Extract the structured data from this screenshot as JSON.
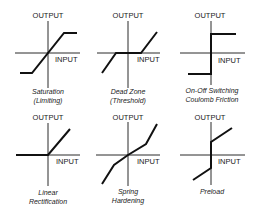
{
  "axis_labels": {
    "y": "OUTPUT",
    "x": "INPUT"
  },
  "panels": [
    {
      "id": "saturation",
      "caption_line1": "Saturation",
      "caption_line2": "(Limiting)"
    },
    {
      "id": "dead-zone",
      "caption_line1": "Dead Zone",
      "caption_line2": "(Threshold)"
    },
    {
      "id": "on-off",
      "caption_line1": "On-Off Switching",
      "caption_line2": "Coulomb Friction"
    },
    {
      "id": "linear-rectification",
      "caption_line1": "Linear",
      "caption_line2": "Rectification"
    },
    {
      "id": "spring-hardening",
      "caption_line1": "Spring",
      "caption_line2": "Hardening"
    },
    {
      "id": "preload",
      "caption_line1": "Preload",
      "caption_line2": ""
    }
  ],
  "colors": {
    "line": "#111111",
    "axis": "#2a2a2a",
    "background": "#ffffff"
  }
}
